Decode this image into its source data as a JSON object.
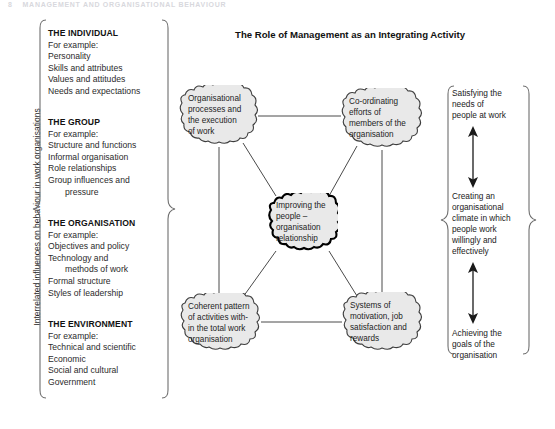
{
  "page_header": {
    "page_number": "8",
    "text": "MANAGEMENT AND ORGANISATIONAL BEHAVIOUR"
  },
  "left_axis": {
    "label": "Interrelated influences on behaviour in work organisations"
  },
  "diagram": {
    "title": "The Role of Management as an Integrating Activity"
  },
  "influences": {
    "groups": [
      {
        "title": "THE INDIVIDUAL",
        "lines": [
          {
            "text": "For example:",
            "indent": false
          },
          {
            "text": "Personality",
            "indent": false
          },
          {
            "text": "Skills and attributes",
            "indent": false
          },
          {
            "text": "Values and attitudes",
            "indent": false
          },
          {
            "text": "Needs and expectations",
            "indent": false
          }
        ]
      },
      {
        "title": "THE GROUP",
        "lines": [
          {
            "text": "For example:",
            "indent": false
          },
          {
            "text": "Structure and functions",
            "indent": false
          },
          {
            "text": "Informal organisation",
            "indent": false
          },
          {
            "text": "Role relationships",
            "indent": false
          },
          {
            "text": "Group influences and",
            "indent": false
          },
          {
            "text": "pressure",
            "indent": true
          }
        ]
      },
      {
        "title": "THE ORGANISATION",
        "lines": [
          {
            "text": "For example:",
            "indent": false
          },
          {
            "text": "Objectives and policy",
            "indent": false
          },
          {
            "text": "Technology and",
            "indent": false
          },
          {
            "text": "methods of work",
            "indent": true
          },
          {
            "text": "Formal structure",
            "indent": false
          },
          {
            "text": "Styles of leadership",
            "indent": false
          }
        ]
      },
      {
        "title": "THE ENVIRONMENT",
        "lines": [
          {
            "text": "For example:",
            "indent": false
          },
          {
            "text": "Technical and scientific",
            "indent": false
          },
          {
            "text": "Economic",
            "indent": false
          },
          {
            "text": "Social and cultural",
            "indent": false
          },
          {
            "text": "Government",
            "indent": false
          }
        ]
      }
    ]
  },
  "nodes": {
    "top_left": {
      "lines": [
        "Organisational",
        "processes and",
        "the execution",
        "of work"
      ]
    },
    "top_right": {
      "lines": [
        "Co-ordinating",
        "efforts of",
        "members of the",
        "organisation"
      ]
    },
    "center": {
      "lines": [
        "Improving the",
        "people –",
        "organisation",
        "relationship"
      ]
    },
    "bottom_left": {
      "lines": [
        "Coherent pattern",
        "of activities with-",
        "in the total work",
        "organisation"
      ]
    },
    "bottom_right": {
      "lines": [
        "Systems of",
        "motivation, job",
        "satisfaction and",
        "rewards"
      ]
    }
  },
  "outcomes": {
    "items": [
      {
        "lines": [
          "Satisfying the",
          "needs of",
          "people at work"
        ]
      },
      {
        "lines": [
          "Creating an",
          "organisational",
          "climate in which",
          "people work",
          "willingly and",
          "effectively"
        ]
      },
      {
        "lines": [
          "Achieving the",
          "goals of the",
          "organisation"
        ]
      }
    ]
  },
  "right_axis": {
    "label": "Organisational performance and effectiveness"
  },
  "colors": {
    "cloud_fill": "#e9e9e9",
    "cloud_stroke": "#3d3d3d",
    "center_stroke": "#000000",
    "connector": "#4a4a4a",
    "bracket": "#6e6e6e",
    "text": "#1d1d1d"
  }
}
